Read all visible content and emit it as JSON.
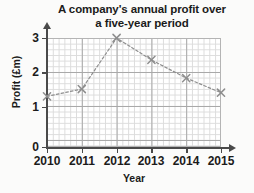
{
  "chart_data": {
    "type": "line",
    "title": "A company's annual profit over a five-year period",
    "title_line1": "A company's annual profit over",
    "title_line2": "a five-year period",
    "xlabel": "Year",
    "ylabel": "Profit (£m)",
    "categories": [
      "2010",
      "2011",
      "2012",
      "2013",
      "2014",
      "2015"
    ],
    "x": [
      2010,
      2011,
      2012,
      2013,
      2014,
      2015
    ],
    "values": [
      1.4,
      1.6,
      3.0,
      2.4,
      1.9,
      1.5
    ],
    "series": [
      {
        "name": "Annual profit",
        "values": [
          1.4,
          1.6,
          3.0,
          2.4,
          1.9,
          1.5
        ]
      }
    ],
    "xlim": [
      2010,
      2015
    ],
    "ylim": [
      0,
      3
    ],
    "xticks": [
      "2010",
      "2011",
      "2012",
      "2013",
      "2014",
      "2015"
    ],
    "yticks": [
      "0",
      "1",
      "2",
      "3"
    ],
    "ytick_values": [
      0,
      1,
      2,
      3
    ],
    "grid": true,
    "grid_style": "graph-paper minor and major gridlines",
    "legend": "none",
    "marker": "x-cross",
    "line_style": "dashed",
    "series_color": "#8e8e8e",
    "marker_color": "#8e8e8e",
    "grid_minor_color": "#dcdcdc",
    "grid_major_color": "#a9a9a9",
    "axis_color": "#4a4a4a",
    "text_color": "#1b1b1b",
    "plot_background": "#ffffff",
    "page_background": "#fbfbfa"
  }
}
